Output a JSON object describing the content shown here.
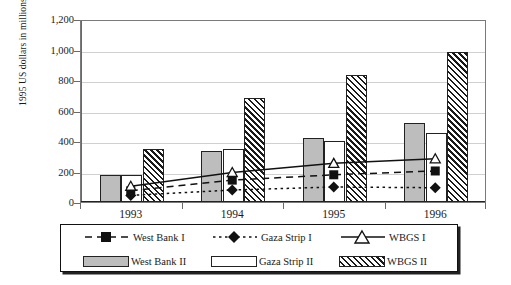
{
  "chart_data": {
    "type": "bar",
    "title": "",
    "xlabel": "",
    "ylabel": "1995 US dollars in millions",
    "categories": [
      "1993",
      "1994",
      "1995",
      "1996"
    ],
    "ylim": [
      0,
      1200
    ],
    "yticks": [
      0,
      200,
      400,
      600,
      800,
      1000,
      1200
    ],
    "ytick_labels": [
      "0",
      "200",
      "400",
      "600",
      "800",
      "1,000",
      "1,200"
    ],
    "grid": true,
    "legend_position": "bottom",
    "bar_series": [
      {
        "name": "West Bank II",
        "style": "gray-fill",
        "values": [
          175,
          335,
          420,
          520
        ]
      },
      {
        "name": "Gaza Strip II",
        "style": "white-fill",
        "values": [
          180,
          350,
          400,
          450
        ]
      },
      {
        "name": "WBGS II",
        "style": "hatched",
        "values": [
          350,
          680,
          835,
          985
        ]
      }
    ],
    "line_series": [
      {
        "name": "West Bank I",
        "marker": "filled-square",
        "dash": "dashed",
        "values": [
          80,
          150,
          185,
          210
        ]
      },
      {
        "name": "Gaza Strip I",
        "marker": "filled-diamond",
        "dash": "dotted",
        "values": [
          50,
          85,
          105,
          100
        ]
      },
      {
        "name": "WBGS I",
        "marker": "open-triangle",
        "dash": "solid",
        "values": [
          110,
          200,
          260,
          290
        ]
      }
    ]
  },
  "legend": {
    "items": [
      {
        "label": "West Bank I",
        "key": "dashed-line-filled-square-marker"
      },
      {
        "label": "Gaza Strip I",
        "key": "dotted-line-filled-diamond-marker"
      },
      {
        "label": "WBGS I",
        "key": "solid-line-open-triangle-marker"
      },
      {
        "label": "West Bank II",
        "key": "gray-bar-swatch"
      },
      {
        "label": "Gaza Strip II",
        "key": "white-bar-swatch"
      },
      {
        "label": "WBGS II",
        "key": "hatched-bar-swatch"
      }
    ]
  },
  "colors": {
    "bar_gray": "#bdbdbd",
    "bar_white": "#ffffff",
    "hatch": "#1a1a1a",
    "outline": "#222222",
    "grid": "#d0d0d0",
    "axis": "#6a6a6a",
    "text": "#1a1a1a"
  }
}
